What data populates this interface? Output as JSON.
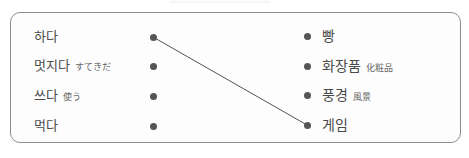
{
  "exercise": {
    "left_items": [
      {
        "word": "하다",
        "note": ""
      },
      {
        "word": "멋지다",
        "note": "すてきだ"
      },
      {
        "word": "쓰다",
        "note": "使う"
      },
      {
        "word": "먹다",
        "note": ""
      }
    ],
    "right_items": [
      {
        "word": "빵",
        "note": ""
      },
      {
        "word": "화장품",
        "note": "化粧品"
      },
      {
        "word": "풍경",
        "note": "風景"
      },
      {
        "word": "게임",
        "note": ""
      }
    ],
    "connections": [
      {
        "from": "하다",
        "to": "게임"
      }
    ],
    "colors": {
      "border": "#8d8d8d",
      "dot": "#555555",
      "line": "#555555",
      "text": "#4a4a4a"
    }
  }
}
